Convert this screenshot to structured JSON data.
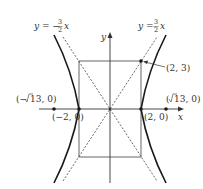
{
  "figure": {
    "type": "hyperbola",
    "equation": "x^2/4 - y^2/9 = 1",
    "axes": {
      "x_label": "x",
      "y_label": "y"
    },
    "asymptotes": [
      {
        "label_prefix": "y = ",
        "sign": "−",
        "num": "3",
        "den": "2",
        "var": "x",
        "slope": -1.5
      },
      {
        "label_prefix": "y = ",
        "sign": "",
        "num": "3",
        "den": "2",
        "var": "x",
        "slope": 1.5
      }
    ],
    "points": {
      "corner": {
        "label": "(2, 3)",
        "x": 2,
        "y": 3
      },
      "vertex_left": {
        "label": "(−2, 0)",
        "x": -2,
        "y": 0
      },
      "vertex_right": {
        "label": "(2, 0)",
        "x": 2,
        "y": 0
      },
      "focus_left": {
        "label_open": "(−",
        "label_rad": "13, 0)",
        "x": -3.606,
        "y": 0
      },
      "focus_right": {
        "label_open": "(",
        "label_rad": "13, 0)",
        "x": 3.606,
        "y": 0
      }
    },
    "colors": {
      "curve": "#1a1a1a",
      "axis": "#333333",
      "rect": "#555555",
      "asymptote": "#444444"
    }
  }
}
